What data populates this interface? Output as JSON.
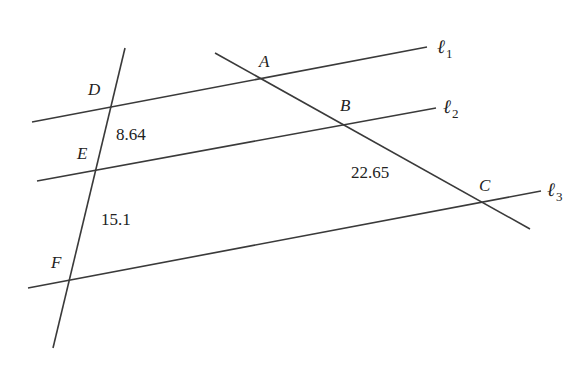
{
  "diagram": {
    "type": "parallel-lines-transversals",
    "parallel_lines": [
      {
        "name": "l1",
        "label": "ℓ",
        "subscript": "1"
      },
      {
        "name": "l2",
        "label": "ℓ",
        "subscript": "2"
      },
      {
        "name": "l3",
        "label": "ℓ",
        "subscript": "3"
      }
    ],
    "points": {
      "A": "A",
      "B": "B",
      "C": "C",
      "D": "D",
      "E": "E",
      "F": "F"
    },
    "segment_labels": {
      "DE": "8.64",
      "EF": "15.1",
      "BC": "22.65"
    },
    "colors": {
      "line": "#3a3a3a",
      "text": "#222222",
      "background": "#ffffff"
    }
  }
}
